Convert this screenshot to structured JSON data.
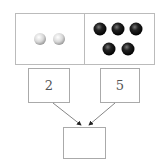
{
  "diagram": {
    "top_panel": {
      "left": {
        "ball_color": "white",
        "count": 2
      },
      "right": {
        "ball_color": "black",
        "count": 5
      }
    },
    "boxes": [
      {
        "id": "left-number-box",
        "value": "2"
      },
      {
        "id": "right-number-box",
        "value": "5"
      },
      {
        "id": "result-box",
        "value": ""
      }
    ]
  }
}
